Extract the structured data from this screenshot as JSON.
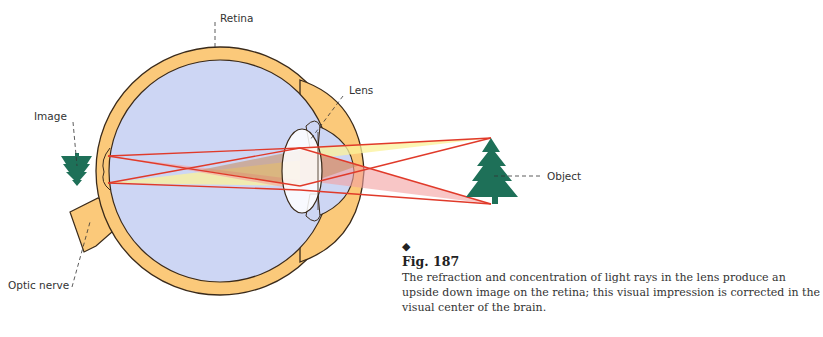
{
  "labels": {
    "retina": "Retina",
    "lens": "Lens",
    "image": "Image",
    "optic_nerve": "Optic nerve",
    "object": "Object"
  },
  "caption": {
    "bullet": "◆",
    "figure": "Fig. 187",
    "text": "The refraction and concentration of light rays in the lens produce an upside down image on the retina; this visual impression is corrected in the visual center of the brain."
  },
  "colors": {
    "sclera": "#fbc97a",
    "eyeball": "#cdd6f4",
    "outline": "#3a2a1a",
    "ray": "#e03a2a",
    "tree": "#1e7058",
    "cone_yellow": "#fbf29a",
    "cone_red": "#f3a0a0",
    "cone_brown": "#c98a5a",
    "lens": "#ffffff"
  }
}
